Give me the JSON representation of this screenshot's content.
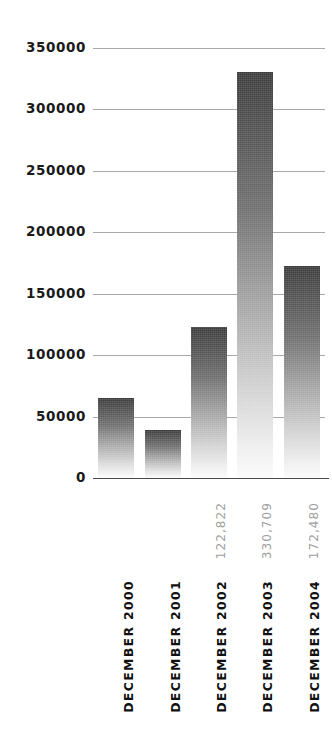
{
  "chart_data": {
    "type": "bar",
    "title": "",
    "subtitle": "",
    "xlabel": "",
    "ylabel": "",
    "grid": true,
    "legend": false,
    "legend_position": "none",
    "ylim": [
      0,
      350000
    ],
    "ytick_labels": [
      "350000",
      "300000",
      "250000",
      "200000",
      "150000",
      "100000",
      "50000",
      "0"
    ],
    "ytick_values": [
      350000,
      300000,
      250000,
      200000,
      150000,
      100000,
      50000,
      0
    ],
    "categories": [
      "DECEMBER 2000",
      "DECEMBER 2001",
      "DECEMBER 2002",
      "DECEMBER 2003",
      "DECEMBER 2004"
    ],
    "values": [
      65000,
      39000,
      122822,
      330709,
      172480
    ],
    "data_labels": [
      "",
      "",
      "122,822",
      "330,709",
      "172,480"
    ],
    "series": [
      {
        "name": "",
        "values": [
          65000,
          39000,
          122822,
          330709,
          172480
        ]
      }
    ],
    "colors": {
      "bar_top": "#3a3a3a",
      "bar_bottom": "#fbfbfb",
      "gridline": "#9a9a9a",
      "axis": "#4a4a4a",
      "tick_text": "#1a1a1a",
      "value_label_text": "#a0a0a0",
      "category_label_text": "#111111",
      "background": "#ffffff"
    }
  }
}
